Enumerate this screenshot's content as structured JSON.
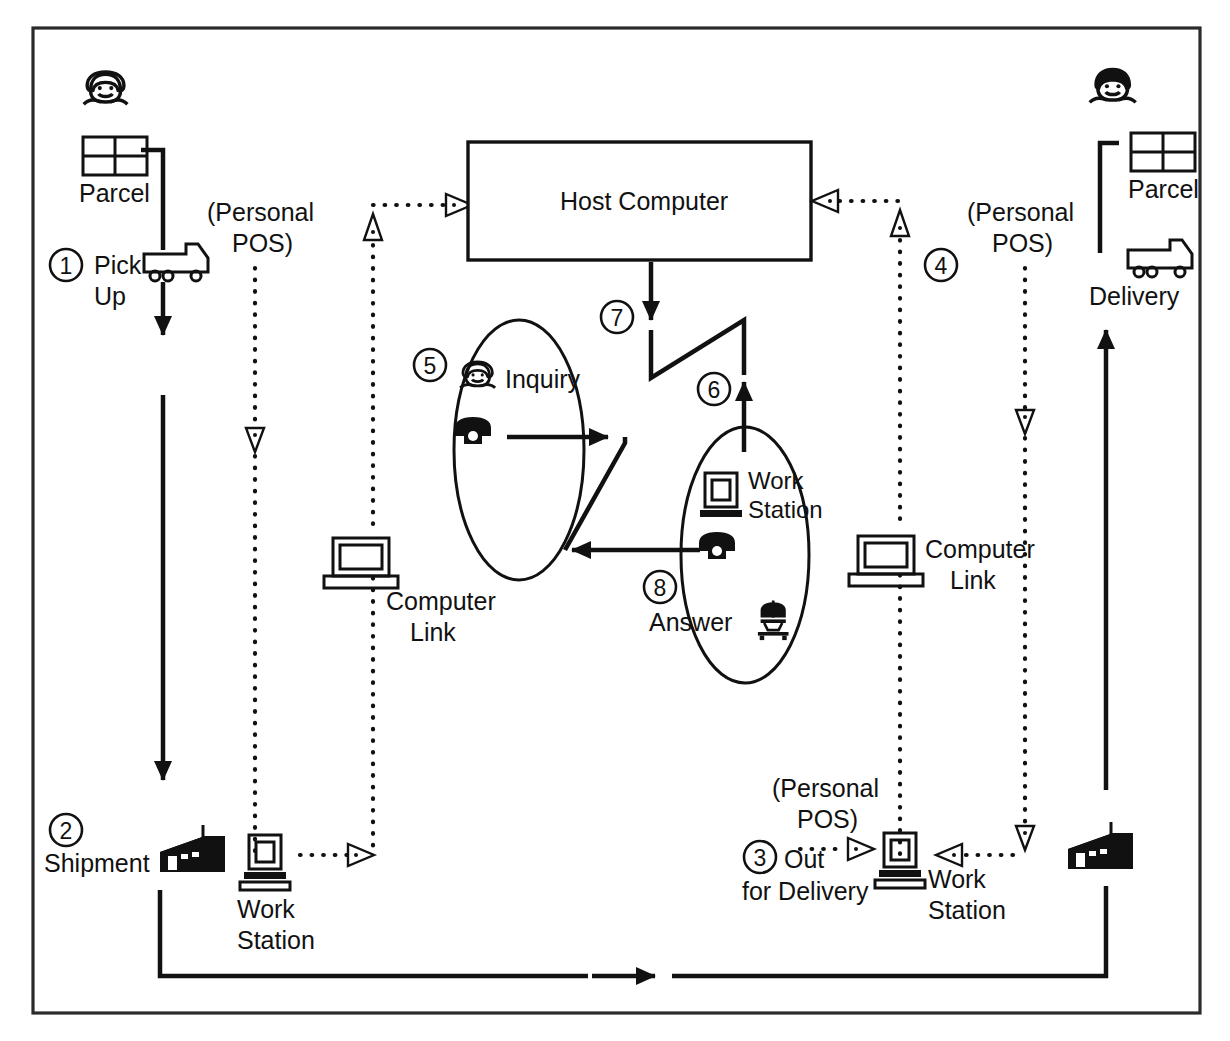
{
  "diagram": {
    "host": {
      "label": "Host Computer"
    },
    "steps": [
      {
        "id": "1",
        "number": "1",
        "label_line1": "Pick",
        "label_line2": "Up"
      },
      {
        "id": "2",
        "number": "2",
        "label_line1": "Shipment",
        "label_line2": ""
      },
      {
        "id": "3",
        "number": "3",
        "label_line1": "Out",
        "label_line2": "for Delivery"
      },
      {
        "id": "4",
        "number": "4",
        "label_line1": "",
        "label_line2": ""
      },
      {
        "id": "5",
        "number": "5",
        "label_line1": "Inquiry",
        "label_line2": ""
      },
      {
        "id": "6",
        "number": "6",
        "label_line1": "",
        "label_line2": ""
      },
      {
        "id": "7",
        "number": "7",
        "label_line1": "",
        "label_line2": ""
      },
      {
        "id": "8",
        "number": "8",
        "label_line1": "Answer",
        "label_line2": ""
      }
    ],
    "labels": {
      "parcel_left": "Parcel",
      "parcel_right": "Parcel",
      "personal_pos_1": "(Personal",
      "personal_pos_2": "POS)",
      "personal_pos_left_l1": "(Personal",
      "personal_pos_left_l2": "POS)",
      "personal_pos_right_l1": "(Personal",
      "personal_pos_right_l2": "POS)",
      "personal_pos_bottom_l1": "(Personal",
      "personal_pos_bottom_l2": "POS)",
      "pick_up_l1": "Pick",
      "pick_up_l2": "Up",
      "delivery": "Delivery",
      "computer_link_left_l1": "Computer",
      "computer_link_left_l2": "Link",
      "computer_link_right_l1": "Computer",
      "computer_link_right_l2": "Link",
      "work_station_bl_l1": "Work",
      "work_station_bl_l2": "Station",
      "work_station_br_l1": "Work",
      "work_station_br_l2": "Station",
      "work_station_mid_l1": "Work",
      "work_station_mid_l2": "Station",
      "shipment": "Shipment",
      "out_for_delivery_l1": "Out",
      "out_for_delivery_l2": "for Delivery",
      "inquiry": "Inquiry",
      "answer": "Answer"
    },
    "icons": {
      "customer_left": "person-face-icon",
      "customer_right": "person-face-icon",
      "parcel_left": "parcel-box-icon",
      "parcel_right": "parcel-box-icon",
      "truck_left": "delivery-truck-icon",
      "truck_right": "delivery-truck-icon",
      "laptop_left": "laptop-computer-link-icon",
      "laptop_right": "laptop-computer-link-icon",
      "workstation_bottom_left": "desktop-workstation-icon",
      "workstation_bottom_right": "desktop-workstation-icon",
      "workstation_mid": "desktop-workstation-icon",
      "phone_inquiry": "telephone-icon",
      "phone_answer": "telephone-icon",
      "agent_face": "person-face-icon",
      "operator_face": "agent-headset-icon",
      "warehouse_left": "warehouse-building-icon",
      "warehouse_right": "warehouse-building-icon"
    },
    "colors": {
      "ink": "#111111",
      "frame": "#2b2b2b",
      "background": "#ffffff"
    }
  }
}
